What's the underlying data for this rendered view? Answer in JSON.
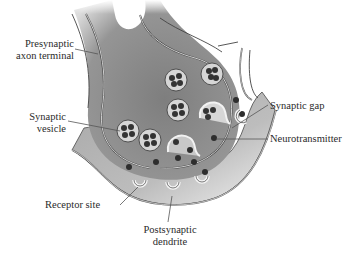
{
  "diagram": {
    "type": "anatomical-illustration",
    "colors": {
      "background": "#ffffff",
      "presynaptic_fill": "#8c8c8c",
      "postsynaptic_fill": "#b4b4b4",
      "cleft_fill": "#c8c8c8",
      "membrane_line": "#f2f2f2",
      "outline": "#3a3a3a",
      "vesicle_fill": "#d8d8d8",
      "neurotransmitter": "#2e2e2e",
      "receptor": "#f4f4f4",
      "label_text": "#2a2a2a",
      "leader_line": "#555555"
    },
    "labels": {
      "presynaptic": {
        "line1": "Presynaptic",
        "line2": "axon terminal"
      },
      "vesicle": {
        "line1": "Synaptic",
        "line2": "vesicle"
      },
      "gap": {
        "line1": "Synaptic gap"
      },
      "neurotransmitter": {
        "line1": "Neurotransmitter"
      },
      "receptor": {
        "line1": "Receptor site"
      },
      "postsynaptic": {
        "line1": "Postsynaptic",
        "line2": "dendrite"
      }
    },
    "vesicle_count": 7,
    "receptor_site_count": 4
  }
}
